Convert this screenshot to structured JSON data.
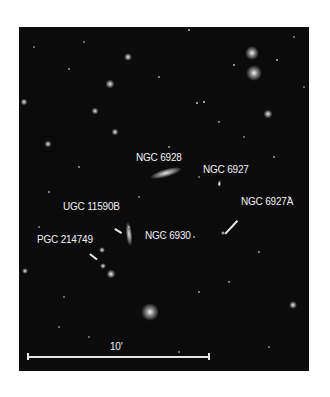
{
  "image": {
    "type": "astronomical-field",
    "background_color": "#0b0b0b",
    "label_color": "#f2f2f2"
  },
  "labels": [
    {
      "id": "ngc6928",
      "text": "NGC 6928",
      "x": 136,
      "y": 153
    },
    {
      "id": "ngc6927",
      "text": "NGC 6927",
      "x": 203,
      "y": 165
    },
    {
      "id": "ngc6927a",
      "text": "NGC 6927A",
      "x": 241,
      "y": 197
    },
    {
      "id": "ugc11590b",
      "text": "UGC 11590B",
      "x": 63,
      "y": 202
    },
    {
      "id": "ngc6930",
      "text": "NGC 6930",
      "x": 145,
      "y": 231
    },
    {
      "id": "pgc214749",
      "text": "PGC 214749",
      "x": 37,
      "y": 235
    }
  ],
  "scale_bar": {
    "label": "10′",
    "x_start": 28,
    "x_end": 209,
    "y": 356
  }
}
